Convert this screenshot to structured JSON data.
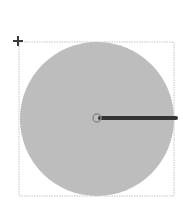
{
  "diagram": {
    "type": "circle-with-radius",
    "bounding_box": {
      "x": 19,
      "y": 42,
      "width": 155,
      "height": 154,
      "stroke": "#c4c4c4"
    },
    "circle": {
      "cx": 97,
      "cy": 119,
      "r": 77,
      "fill": "#bdbdbd"
    },
    "center_marker": {
      "cx": 97,
      "cy": 118,
      "r": 4,
      "stroke": "#8a8a8a"
    },
    "radius_line": {
      "x1": 100,
      "y1": 118,
      "x2": 176,
      "y2": 118,
      "stroke": "#333333",
      "width": 4
    },
    "move_handle": {
      "x": 18,
      "y": 41,
      "color": "#3a3a3a"
    }
  }
}
